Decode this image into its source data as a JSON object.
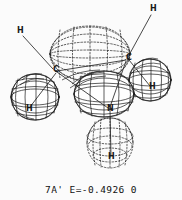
{
  "figure": {
    "kind": "molecular-orbital-wireframe-plot",
    "background_color": "#fbfbfb",
    "line_color": "#1a1a1a",
    "caption": "7A' E=-0.4926 0",
    "orbital_label": "7A'",
    "energy_label": "E=-0.4926",
    "trailing_symbol": "0"
  },
  "atoms": [
    {
      "id": "h-upper-left",
      "label": "H",
      "x": 17,
      "y": 31,
      "leader": true
    },
    {
      "id": "h-upper-right",
      "label": "H",
      "x": 152,
      "y": 9,
      "leader": true
    },
    {
      "id": "c-left",
      "label": "C",
      "x": 54,
      "y": 71,
      "leader": false
    },
    {
      "id": "c-right",
      "label": "C",
      "x": 127,
      "y": 59,
      "leader": false
    },
    {
      "id": "n-center",
      "label": "N",
      "x": 110,
      "y": 110,
      "leader": false
    },
    {
      "id": "h-left-lobe",
      "label": "H",
      "x": 28,
      "y": 110,
      "leader": false
    },
    {
      "id": "h-right-lobe",
      "label": "H",
      "x": 151,
      "y": 88,
      "leader": false
    },
    {
      "id": "h-bottom",
      "label": "H",
      "x": 111,
      "y": 158,
      "leader": false
    }
  ],
  "leader_lines": [
    {
      "id": "leader-h-upper-left",
      "x1": 23,
      "y1": 36,
      "x2": 53,
      "y2": 69
    },
    {
      "id": "leader-h-upper-right",
      "x1": 151,
      "y1": 15,
      "x2": 128,
      "y2": 57
    }
  ],
  "lobes": [
    {
      "id": "lobe-top-negative",
      "phase": "negative",
      "style": "dashed",
      "cx": 90,
      "cy": 54,
      "rx": 40,
      "ry": 27
    },
    {
      "id": "lobe-bottom-negative",
      "phase": "negative",
      "style": "dashed",
      "cx": 110,
      "cy": 143,
      "rx": 23,
      "ry": 25
    },
    {
      "id": "lobe-center-positive",
      "phase": "positive",
      "style": "solid",
      "cx": 104,
      "cy": 94,
      "rx": 30,
      "ry": 23
    },
    {
      "id": "lobe-left-positive",
      "phase": "positive",
      "style": "solid",
      "cx": 35,
      "cy": 97,
      "rx": 24,
      "ry": 23
    },
    {
      "id": "lobe-right-positive",
      "phase": "positive",
      "style": "solid",
      "cx": 150,
      "cy": 80,
      "rx": 21,
      "ry": 21
    }
  ],
  "bonds": [
    {
      "id": "bond-c-left-n",
      "x1": 57,
      "y1": 72,
      "x2": 108,
      "y2": 108
    },
    {
      "id": "bond-c-right-n",
      "x1": 126,
      "y1": 61,
      "x2": 110,
      "y2": 107
    },
    {
      "id": "bond-n-h",
      "x1": 110,
      "y1": 110,
      "x2": 111,
      "y2": 156
    },
    {
      "id": "bond-c-left-h",
      "x1": 56,
      "y1": 73,
      "x2": 30,
      "y2": 107
    },
    {
      "id": "bond-c-right-h",
      "x1": 129,
      "y1": 60,
      "x2": 150,
      "y2": 86
    }
  ]
}
